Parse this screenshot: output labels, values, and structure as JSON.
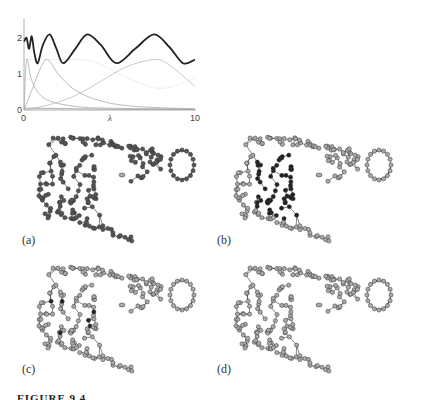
{
  "chart_data": {
    "type": "line",
    "title": "",
    "xlabel": "λ",
    "ylabel": "",
    "xlim": [
      0,
      10
    ],
    "ylim": [
      0,
      2.4
    ],
    "x_ticks": [
      "0",
      "10"
    ],
    "y_ticks": [
      "0",
      "1",
      "2"
    ],
    "grid": false,
    "legend": null,
    "series": [
      {
        "name": "sum (thick black)",
        "color": "#222222",
        "x": [
          0,
          0.15,
          0.3,
          0.45,
          0.6,
          0.8,
          1.1,
          1.5,
          1.9,
          2.3,
          3.0,
          3.7,
          4.5,
          5.4,
          6.5,
          7.6,
          8.5,
          9.3,
          10
        ],
        "y": [
          1.9,
          2.0,
          1.7,
          2.05,
          1.6,
          1.3,
          1.8,
          2.1,
          1.7,
          1.3,
          1.7,
          2.1,
          1.8,
          1.3,
          1.7,
          2.1,
          1.75,
          1.3,
          1.4
        ]
      },
      {
        "name": "component 1",
        "color": "#aaaaaa",
        "x": [
          0,
          0.15,
          0.4,
          0.8,
          1.5,
          3,
          5,
          10
        ],
        "y": [
          0.0,
          1.4,
          0.9,
          0.5,
          0.25,
          0.1,
          0.05,
          0.02
        ]
      },
      {
        "name": "component 2",
        "color": "#aaaaaa",
        "x": [
          0,
          0.5,
          1.0,
          1.4,
          2.0,
          3.0,
          4.5,
          6.5,
          10
        ],
        "y": [
          0.0,
          0.6,
          1.2,
          1.4,
          1.0,
          0.55,
          0.25,
          0.1,
          0.03
        ]
      },
      {
        "name": "component 3",
        "color": "#bbbbbb",
        "x": [
          0,
          1.5,
          3,
          4.5,
          6,
          7.6,
          8.5,
          10
        ],
        "y": [
          0.0,
          0.15,
          0.4,
          0.8,
          1.2,
          1.4,
          1.25,
          0.65
        ]
      },
      {
        "name": "component 4 (dotted)",
        "color": "#cccccc",
        "x": [
          0,
          1,
          2.5,
          4,
          6,
          8,
          10
        ],
        "y": [
          1.4,
          1.4,
          1.4,
          1.35,
          0.9,
          0.6,
          0.9
        ]
      },
      {
        "name": "baseline component",
        "color": "#999999",
        "x": [
          0,
          2,
          4,
          6,
          8,
          10
        ],
        "y": [
          0.05,
          0.04,
          0.03,
          0.02,
          0.02,
          0.02
        ]
      }
    ]
  },
  "panels": [
    {
      "label": "(a)",
      "highlight": "all-dark"
    },
    {
      "label": "(b)",
      "highlight": "center-cluster-dark"
    },
    {
      "label": "(c)",
      "highlight": "few-dark"
    },
    {
      "label": "(d)",
      "highlight": "none"
    }
  ],
  "caption": "FIGURE 9.4"
}
